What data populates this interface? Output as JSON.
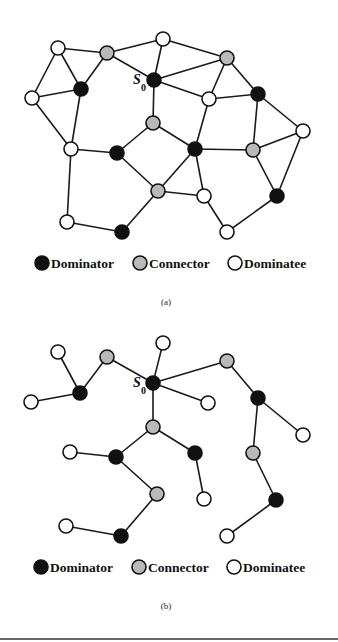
{
  "colors": {
    "dominator": "#111111",
    "connector": "#b9b9b9",
    "dominatee": "#ffffff",
    "edge": "#1a1a1a"
  },
  "node_radius": 7,
  "figures": [
    {
      "id": "a",
      "caption": "(a)",
      "root_label": {
        "text": "S",
        "subscript": "0",
        "x": 133,
        "y": 84,
        "sub_x": 141,
        "sub_y": 91
      },
      "nodes": [
        {
          "id": "n1",
          "x": 58,
          "y": 48,
          "type": "dominatee"
        },
        {
          "id": "n2",
          "x": 107,
          "y": 53,
          "type": "connector"
        },
        {
          "id": "n3",
          "x": 163,
          "y": 39,
          "type": "dominatee"
        },
        {
          "id": "n4",
          "x": 227,
          "y": 58,
          "type": "connector"
        },
        {
          "id": "s0",
          "x": 154,
          "y": 80,
          "type": "dominator"
        },
        {
          "id": "n6",
          "x": 81,
          "y": 89,
          "type": "dominator"
        },
        {
          "id": "n7",
          "x": 32,
          "y": 98,
          "type": "dominatee"
        },
        {
          "id": "n8",
          "x": 209,
          "y": 99,
          "type": "dominatee"
        },
        {
          "id": "n9",
          "x": 258,
          "y": 94,
          "type": "dominator"
        },
        {
          "id": "n10",
          "x": 153,
          "y": 123,
          "type": "connector"
        },
        {
          "id": "n11",
          "x": 303,
          "y": 131,
          "type": "dominatee"
        },
        {
          "id": "n12",
          "x": 71,
          "y": 149,
          "type": "dominatee"
        },
        {
          "id": "n13",
          "x": 117,
          "y": 153,
          "type": "dominator"
        },
        {
          "id": "n14",
          "x": 195,
          "y": 149,
          "type": "dominator"
        },
        {
          "id": "n15",
          "x": 253,
          "y": 150,
          "type": "connector"
        },
        {
          "id": "n16",
          "x": 158,
          "y": 191,
          "type": "connector"
        },
        {
          "id": "n17",
          "x": 204,
          "y": 196,
          "type": "dominatee"
        },
        {
          "id": "n18",
          "x": 277,
          "y": 196,
          "type": "dominator"
        },
        {
          "id": "n19",
          "x": 67,
          "y": 222,
          "type": "dominatee"
        },
        {
          "id": "n20",
          "x": 122,
          "y": 232,
          "type": "dominator"
        },
        {
          "id": "n21",
          "x": 227,
          "y": 232,
          "type": "dominatee"
        }
      ],
      "edges": [
        [
          "n1",
          "n2"
        ],
        [
          "n1",
          "n6"
        ],
        [
          "n1",
          "n7"
        ],
        [
          "n2",
          "n6"
        ],
        [
          "n6",
          "n7"
        ],
        [
          "n2",
          "n3"
        ],
        [
          "n2",
          "s0"
        ],
        [
          "n3",
          "s0"
        ],
        [
          "n3",
          "n4"
        ],
        [
          "s0",
          "n4"
        ],
        [
          "s0",
          "n8"
        ],
        [
          "s0",
          "n10"
        ],
        [
          "n4",
          "n8"
        ],
        [
          "n4",
          "n9"
        ],
        [
          "n8",
          "n9"
        ],
        [
          "n8",
          "n14"
        ],
        [
          "n9",
          "n11"
        ],
        [
          "n9",
          "n15"
        ],
        [
          "n7",
          "n12"
        ],
        [
          "n6",
          "n12"
        ],
        [
          "n12",
          "n13"
        ],
        [
          "n12",
          "n19"
        ],
        [
          "n13",
          "n10"
        ],
        [
          "n13",
          "n16"
        ],
        [
          "n10",
          "n14"
        ],
        [
          "n14",
          "n15"
        ],
        [
          "n14",
          "n17"
        ],
        [
          "n14",
          "n16"
        ],
        [
          "n16",
          "n17"
        ],
        [
          "n15",
          "n11"
        ],
        [
          "n15",
          "n18"
        ],
        [
          "n11",
          "n18"
        ],
        [
          "n16",
          "n20"
        ],
        [
          "n19",
          "n20"
        ],
        [
          "n17",
          "n21"
        ],
        [
          "n21",
          "n18"
        ]
      ],
      "legend": {
        "y": 263,
        "items": [
          {
            "type": "dominator",
            "label": "Dominator",
            "cx": 42,
            "tx": 51
          },
          {
            "type": "connector",
            "label": "Connector",
            "cx": 140,
            "tx": 149
          },
          {
            "type": "dominatee",
            "label": "Dominatee",
            "cx": 235,
            "tx": 244
          }
        ]
      },
      "caption_pos": {
        "x": 166,
        "y": 305
      }
    },
    {
      "id": "b",
      "caption": "(b)",
      "root_label": {
        "text": "S",
        "subscript": "0",
        "x": 133,
        "y": 387,
        "sub_x": 141,
        "sub_y": 394
      },
      "nodes": [
        {
          "id": "m1",
          "x": 58,
          "y": 352,
          "type": "dominatee"
        },
        {
          "id": "m2",
          "x": 107,
          "y": 357,
          "type": "connector"
        },
        {
          "id": "m3",
          "x": 163,
          "y": 343,
          "type": "dominatee"
        },
        {
          "id": "m4",
          "x": 227,
          "y": 361,
          "type": "connector"
        },
        {
          "id": "t0",
          "x": 153,
          "y": 383,
          "type": "dominator"
        },
        {
          "id": "m6",
          "x": 80,
          "y": 393,
          "type": "dominator"
        },
        {
          "id": "m7",
          "x": 31,
          "y": 402,
          "type": "dominatee"
        },
        {
          "id": "m8",
          "x": 208,
          "y": 403,
          "type": "dominatee"
        },
        {
          "id": "m9",
          "x": 258,
          "y": 398,
          "type": "dominator"
        },
        {
          "id": "m10",
          "x": 153,
          "y": 427,
          "type": "connector"
        },
        {
          "id": "m11",
          "x": 303,
          "y": 435,
          "type": "dominatee"
        },
        {
          "id": "m12",
          "x": 70,
          "y": 452,
          "type": "dominatee"
        },
        {
          "id": "m13",
          "x": 116,
          "y": 457,
          "type": "dominator"
        },
        {
          "id": "m14",
          "x": 195,
          "y": 453,
          "type": "dominator"
        },
        {
          "id": "m15",
          "x": 253,
          "y": 453,
          "type": "connector"
        },
        {
          "id": "m16",
          "x": 157,
          "y": 494,
          "type": "connector"
        },
        {
          "id": "m17",
          "x": 204,
          "y": 499,
          "type": "dominatee"
        },
        {
          "id": "m18",
          "x": 276,
          "y": 500,
          "type": "dominator"
        },
        {
          "id": "m19",
          "x": 66,
          "y": 526,
          "type": "dominatee"
        },
        {
          "id": "m20",
          "x": 121,
          "y": 536,
          "type": "dominator"
        },
        {
          "id": "m21",
          "x": 227,
          "y": 536,
          "type": "dominatee"
        }
      ],
      "edges": [
        [
          "m1",
          "m6"
        ],
        [
          "m2",
          "m6"
        ],
        [
          "m7",
          "m6"
        ],
        [
          "m2",
          "t0"
        ],
        [
          "m3",
          "t0"
        ],
        [
          "t0",
          "m4"
        ],
        [
          "t0",
          "m8"
        ],
        [
          "t0",
          "m10"
        ],
        [
          "m10",
          "m13"
        ],
        [
          "m10",
          "m14"
        ],
        [
          "m12",
          "m13"
        ],
        [
          "m13",
          "m16"
        ],
        [
          "m14",
          "m17"
        ],
        [
          "m16",
          "m20"
        ],
        [
          "m19",
          "m20"
        ],
        [
          "m4",
          "m9"
        ],
        [
          "m9",
          "m11"
        ],
        [
          "m9",
          "m15"
        ],
        [
          "m15",
          "m18"
        ],
        [
          "m18",
          "m21"
        ]
      ],
      "legend": {
        "y": 567,
        "items": [
          {
            "type": "dominator",
            "label": "Dominator",
            "cx": 41,
            "tx": 50
          },
          {
            "type": "connector",
            "label": "Connector",
            "cx": 139,
            "tx": 148
          },
          {
            "type": "dominatee",
            "label": "Dominatee",
            "cx": 234,
            "tx": 243
          }
        ]
      },
      "caption_pos": {
        "x": 166,
        "y": 609
      }
    }
  ],
  "rule_y": 639
}
